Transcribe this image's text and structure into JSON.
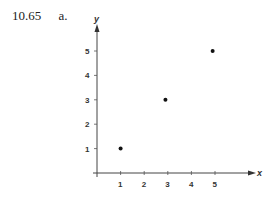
{
  "problem": {
    "number": "10.65",
    "part": "a."
  },
  "chart_data": {
    "type": "scatter",
    "title": "",
    "xlabel": "x",
    "ylabel": "y",
    "x_ticks": [
      1,
      2,
      3,
      4,
      5
    ],
    "y_ticks": [
      1,
      2,
      3,
      4,
      5
    ],
    "points": [
      {
        "x": 1,
        "y": 1
      },
      {
        "x": 2.9,
        "y": 3
      },
      {
        "x": 4.9,
        "y": 5
      }
    ],
    "xlim": [
      0,
      6.5
    ],
    "ylim": [
      0,
      6
    ],
    "grid": false,
    "legend": null
  }
}
